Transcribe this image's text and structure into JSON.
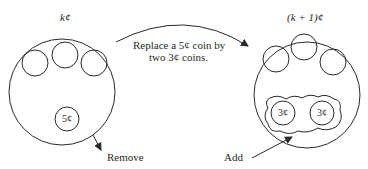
{
  "diagram": {
    "left_pile": {
      "title": "k¢",
      "coin_label": "5¢",
      "action": "Remove"
    },
    "right_pile": {
      "title": "(k + 1)¢",
      "coin_labels": [
        "3¢",
        "3¢"
      ],
      "action": "Add"
    },
    "transition": {
      "line1": "Replace a 5¢ coin by",
      "line2": "two 3¢ coins."
    },
    "stroke_color": "#2a2a2a"
  }
}
